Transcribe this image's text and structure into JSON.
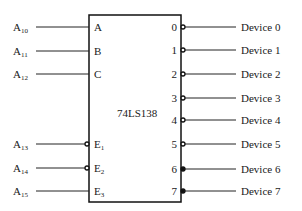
{
  "chip": {
    "name": "74LS138"
  },
  "inputs": [
    {
      "signal": "A",
      "sub": "10",
      "pin": "A",
      "pin_sub": "",
      "active_low": false
    },
    {
      "signal": "A",
      "sub": "11",
      "pin": "B",
      "pin_sub": "",
      "active_low": false
    },
    {
      "signal": "A",
      "sub": "12",
      "pin": "C",
      "pin_sub": "",
      "active_low": false
    },
    {
      "signal": "A",
      "sub": "13",
      "pin": "E",
      "pin_sub": "1",
      "active_low": true
    },
    {
      "signal": "A",
      "sub": "14",
      "pin": "E",
      "pin_sub": "2",
      "active_low": true
    },
    {
      "signal": "A",
      "sub": "15",
      "pin": "E",
      "pin_sub": "3",
      "active_low": false
    }
  ],
  "outputs": [
    {
      "pin": "0",
      "device": "Device 0"
    },
    {
      "pin": "1",
      "device": "Device 1"
    },
    {
      "pin": "2",
      "device": "Device 2"
    },
    {
      "pin": "3",
      "device": "Device 3"
    },
    {
      "pin": "4",
      "device": "Device 4"
    },
    {
      "pin": "5",
      "device": "Device 5"
    },
    {
      "pin": "6",
      "device": "Device 6"
    },
    {
      "pin": "7",
      "device": "Device 7"
    }
  ]
}
